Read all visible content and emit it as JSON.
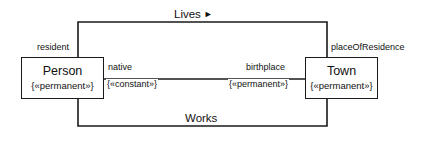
{
  "diagram": {
    "type": "uml-class-diagram",
    "classes": [
      {
        "id": "person",
        "name": "Person",
        "stereotype": "{«permanent»}"
      },
      {
        "id": "town",
        "name": "Town",
        "stereotype": "{«permanent»}"
      }
    ],
    "associations": [
      {
        "id": "lives",
        "name": "Lives",
        "navigation_arrow": "►",
        "position": "top",
        "source_role": "resident",
        "target_role": "placeOfResidence"
      },
      {
        "id": "native-birthplace",
        "name": "",
        "position": "middle",
        "source_role": "native",
        "source_role_constraint": "{«constant»}",
        "target_role": "birthplace",
        "target_role_constraint": "{«permanent»}"
      },
      {
        "id": "works",
        "name": "Works",
        "position": "bottom"
      }
    ],
    "colors": {
      "line": "#1a1a1a",
      "text": "#111111",
      "background": "#ffffff"
    }
  }
}
